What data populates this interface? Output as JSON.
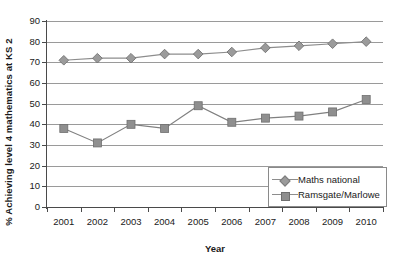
{
  "chart_data": {
    "type": "line",
    "title": "",
    "xlabel": "Year",
    "ylabel": "% Achieving level 4 mathematics at KS 2",
    "categories": [
      "2001",
      "2002",
      "2003",
      "2004",
      "2005",
      "2006",
      "2007",
      "2008",
      "2009",
      "2010"
    ],
    "ylim": [
      0,
      90
    ],
    "ytick_step": 10,
    "yticks": [
      "90",
      "80",
      "70",
      "60",
      "50",
      "40",
      "30",
      "20",
      "10",
      "0"
    ],
    "grid": true,
    "grid_axis": "y",
    "legend_position": "bottom-right",
    "series": [
      {
        "name": "Maths national",
        "marker": "diamond",
        "color": "#9b9b9b",
        "line_color": "#8d8d8d",
        "values": [
          71,
          72,
          72,
          74,
          74,
          75,
          77,
          78,
          79,
          80
        ]
      },
      {
        "name": "Ramsgate/Marlowe",
        "marker": "square",
        "color": "#8f8f8f",
        "line_color": "#808080",
        "values": [
          38,
          31,
          40,
          38,
          49,
          41,
          43,
          44,
          46,
          52
        ]
      }
    ]
  },
  "axes": {
    "y_title": "% Achieving level 4 mathematics at KS 2",
    "x_title": "Year"
  },
  "legend": {
    "items": [
      {
        "label": "Maths national"
      },
      {
        "label": "Ramsgate/Marlowe"
      }
    ]
  }
}
